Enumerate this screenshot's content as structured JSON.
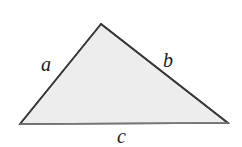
{
  "figure": {
    "kind": "geometry-diagram",
    "shape": "triangle",
    "background_color": "#ffffff",
    "fill_color": "#ededee",
    "stroke_color": "#3a3a3c",
    "stroke_width": 1.6,
    "vertices": {
      "apex": {
        "x": 101,
        "y": 24
      },
      "bottom_left": {
        "x": 20,
        "y": 124
      },
      "bottom_right": {
        "x": 228,
        "y": 123
      }
    },
    "labels": {
      "left_side": "a",
      "right_side": "b",
      "bottom_side": "c"
    },
    "label_positions": {
      "left_side": {
        "x": 48,
        "y": 66
      },
      "right_side": {
        "x": 171,
        "y": 62
      },
      "bottom_side": {
        "x": 124,
        "y": 137
      }
    }
  }
}
